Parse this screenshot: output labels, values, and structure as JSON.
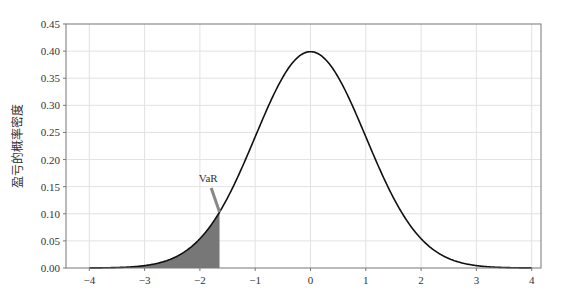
{
  "chart_data": {
    "type": "line",
    "title": "",
    "xlabel": "",
    "ylabel": "盈亏的概率密度",
    "xlim": [
      -4.4,
      4.4
    ],
    "ylim": [
      0,
      0.45
    ],
    "grid": true,
    "legend": null,
    "xticks": [
      -4,
      -3,
      -2,
      -1,
      0,
      1,
      2,
      3,
      4
    ],
    "xtick_labels": [
      "−4",
      "−3",
      "−2",
      "−1",
      "0",
      "1",
      "2",
      "3",
      "4"
    ],
    "yticks": [
      0.0,
      0.05,
      0.1,
      0.15,
      0.2,
      0.25,
      0.3,
      0.35,
      0.4,
      0.45
    ],
    "ytick_labels": [
      "0.00",
      "0.05",
      "0.10",
      "0.15",
      "0.20",
      "0.25",
      "0.30",
      "0.35",
      "0.40",
      "0.45"
    ],
    "series": [
      {
        "name": "standard normal pdf",
        "x": [
          -4,
          -3.5,
          -3,
          -2.5,
          -2,
          -1.645,
          -1.5,
          -1,
          -0.5,
          0,
          0.5,
          1,
          1.5,
          2,
          2.5,
          3,
          3.5,
          4
        ],
        "values": [
          0.0001,
          0.0009,
          0.0044,
          0.0175,
          0.054,
          0.1031,
          0.1295,
          0.242,
          0.3521,
          0.3989,
          0.3521,
          0.242,
          0.1295,
          0.054,
          0.0175,
          0.0044,
          0.0009,
          0.0001
        ],
        "color": "#111111"
      }
    ],
    "shaded_region": {
      "from": -4,
      "to": -1.645,
      "color": "#777777",
      "label": "left tail"
    },
    "annotations": [
      {
        "text": "VaR",
        "xy": [
          -1.645,
          0.1031
        ],
        "xytext": [
          -1.85,
          0.155
        ]
      }
    ]
  },
  "labels": {
    "ylabel": "盈亏的概率密度",
    "annotation": "VaR"
  }
}
